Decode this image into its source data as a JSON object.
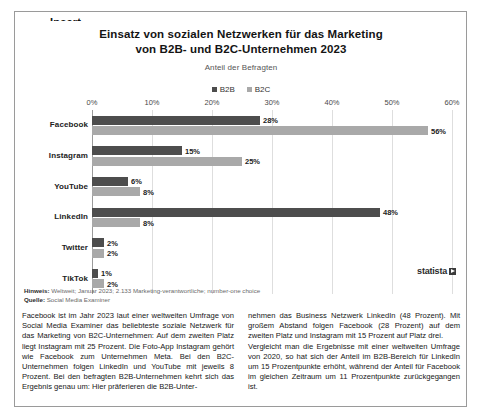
{
  "frame": {
    "legend_label": "Insert"
  },
  "chart": {
    "title_line1": "Einsatz von sozialen Netzwerken für das Marketing",
    "title_line2": "von B2B- und B2C-Unternehmen 2023",
    "subtitle": "Anteil der Befragten",
    "source_brand": "statista",
    "note_label": "Hinweis:",
    "note_text": "Weltweit; Januar 2023; 2.133 Marketing-verantwortliche; number-one choice",
    "source_label": "Quelle:",
    "source_text": "Social Media Examiner",
    "colors": {
      "b2b": "#4d4d4d",
      "b2c": "#a9a9a9",
      "gridline": "#dedede",
      "axis": "#9b9b9b"
    }
  },
  "chart_data": {
    "type": "bar",
    "orientation": "horizontal",
    "title": "Einsatz von sozialen Netzwerken für das Marketing von B2B- und B2C-Unternehmen 2023",
    "subtitle": "Anteil der Befragten",
    "xlabel": "",
    "ylabel": "",
    "xlim": [
      0,
      60
    ],
    "xticks": [
      0,
      10,
      20,
      30,
      40,
      50,
      60
    ],
    "xtick_labels": [
      "0%",
      "10%",
      "20%",
      "30%",
      "40%",
      "50%",
      "60%"
    ],
    "grid": true,
    "legend_position": "top-center",
    "value_suffix": "%",
    "categories": [
      "Facebook",
      "Instagram",
      "YouTube",
      "LinkedIn",
      "Twitter",
      "TikTok"
    ],
    "series": [
      {
        "name": "B2B",
        "color": "#4d4d4d",
        "values": [
          28,
          15,
          6,
          48,
          2,
          1
        ],
        "labels": [
          "28%",
          "15%",
          "6%",
          "48%",
          "2%",
          "1%"
        ]
      },
      {
        "name": "B2C",
        "color": "#a9a9a9",
        "values": [
          56,
          25,
          8,
          8,
          2,
          2
        ],
        "labels": [
          "56%",
          "25%",
          "8%",
          "8%",
          "2%",
          "2%"
        ]
      }
    ]
  },
  "article": {
    "left_column": "Facebook ist im Jahr 2023 laut einer weltweiten Umfrage von Social Media Examiner das beliebteste soziale Netzwerk für das Marketing von B2C-Unternehmen: Auf dem zweiten Platz liegt Instagram mit 25 Prozent. Die Foto-App Instagram gehört wie Facebook zum Unternehmen Meta. Bei den B2C-Unternehmen folgen LinkedIn und YouTube mit jeweils 8 Prozent. Bei den befragten B2B-Unternehmen kehrt sich das Ergebnis genau um: Hier präferieren die B2B-Unter-",
    "right_column_p1": "nehmen das  Business Netzwerk LinkedIn (48 Prozent). Mit großem Abstand folgen Facebook (28 Prozent) auf dem zweiten Platz und Instagram mit 15 Prozent auf Platz drei.",
    "right_column_p2": "Vergleicht man die Ergebnisse mit einer weltweiten Umfrage von 2020, so hat sich der Anteil im B2B-Bereich für LinkedIn um 15 Prozentpunkte erhöht, während der Anteil für Facebook im gleichen Zeitraum um 11 Prozentpunkte zurückgegangen ist."
  }
}
